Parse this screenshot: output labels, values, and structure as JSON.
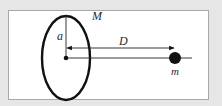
{
  "figure": {
    "labels": {
      "ring_mass": "M",
      "radius": "a",
      "distance": "D",
      "point_mass": "m"
    },
    "elements": [
      {
        "name": "ring",
        "shape": "ellipse",
        "description": "ring of mass M seen in perspective"
      },
      {
        "name": "radius-line",
        "shape": "line",
        "label": "a"
      },
      {
        "name": "center-point",
        "shape": "dot"
      },
      {
        "name": "axis-line",
        "shape": "line"
      },
      {
        "name": "distance-arrow",
        "shape": "double-arrow",
        "label": "D"
      },
      {
        "name": "point-mass",
        "shape": "filled-circle",
        "label": "m"
      }
    ],
    "colors": {
      "background": "#e6e6e6",
      "panel": "#ffffff",
      "panel_border": "#a8a8a8",
      "ink": "#111111"
    }
  }
}
